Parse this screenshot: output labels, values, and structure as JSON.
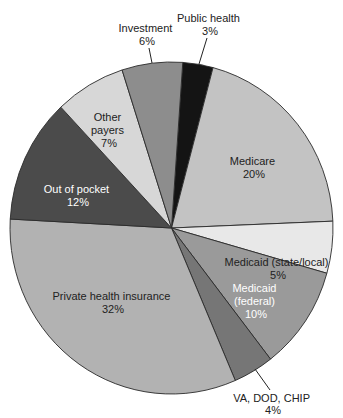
{
  "chart_data": {
    "type": "pie",
    "title": "",
    "unit": "%",
    "start_angle_note": "clockwise from Public health at top",
    "slices": [
      {
        "label": "Public health",
        "value": 3,
        "color": "#141414",
        "text_color": "#222222",
        "label_lines": [
          "Public health",
          "3%"
        ],
        "label_pos": "outside"
      },
      {
        "label": "Medicare",
        "value": 20,
        "color": "#c3c3c3",
        "text_color": "#222222",
        "label_lines": [
          "Medicare",
          "20%"
        ],
        "label_pos": "inside"
      },
      {
        "label": "Medicaid (state/local)",
        "value": 5,
        "color": "#e8e8e8",
        "text_color": "#222222",
        "label_lines": [
          "Medicaid (state/local)",
          "5%"
        ],
        "label_pos": "inside"
      },
      {
        "label": "Medicaid (federal)",
        "value": 10,
        "color": "#9a9a9a",
        "text_color": "#ffffff",
        "label_lines": [
          "Medicaid",
          "(federal)",
          "10%"
        ],
        "label_pos": "inside"
      },
      {
        "label": "VA, DOD, CHIP",
        "value": 4,
        "color": "#767676",
        "text_color": "#222222",
        "label_lines": [
          "VA, DOD, CHIP",
          "4%"
        ],
        "label_pos": "outside"
      },
      {
        "label": "Private health insurance",
        "value": 32,
        "color": "#b2b2b2",
        "text_color": "#222222",
        "label_lines": [
          "Private health insurance",
          "32%"
        ],
        "label_pos": "inside"
      },
      {
        "label": "Out of pocket",
        "value": 12,
        "color": "#4b4b4b",
        "text_color": "#ffffff",
        "label_lines": [
          "Out of pocket",
          "12%"
        ],
        "label_pos": "inside"
      },
      {
        "label": "Other payers",
        "value": 7,
        "color": "#d7d7d7",
        "text_color": "#222222",
        "label_lines": [
          "Other",
          "payers",
          "7%"
        ],
        "label_pos": "inside"
      },
      {
        "label": "Investment",
        "value": 6,
        "color": "#8d8d8d",
        "text_color": "#222222",
        "label_lines": [
          "Investment",
          "6%"
        ],
        "label_pos": "outside"
      }
    ],
    "legend": "none",
    "grid": false
  }
}
